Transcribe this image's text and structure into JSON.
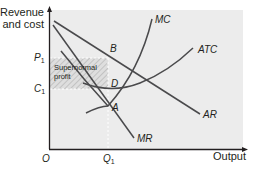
{
  "diagram": {
    "type": "economics-cost-revenue",
    "y_axis_label_line1": "Revenue",
    "y_axis_label_line2": "and cost",
    "x_axis_label": "Output",
    "origin_label": "O",
    "y_ticks": [
      {
        "main": "P",
        "sub": "1"
      },
      {
        "main": "C",
        "sub": "1"
      }
    ],
    "x_ticks": [
      {
        "main": "Q",
        "sub": "1"
      }
    ],
    "curves": {
      "mc": "MC",
      "atc": "ATC",
      "ar": "AR",
      "mr": "MR"
    },
    "points": {
      "a": "A",
      "b": "B",
      "d": "D"
    },
    "region_label_line1": "Supernormal",
    "region_label_line2": "profit",
    "colors": {
      "plot_bg": "#ececec",
      "curve": "#4a4a4c",
      "axis": "#231f20",
      "hatch": "#c8c8c8"
    }
  }
}
